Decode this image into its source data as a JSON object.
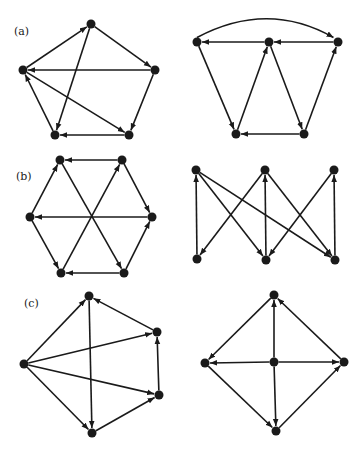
{
  "colors": {
    "ink": "#1a1a1a",
    "background": "#ffffff"
  },
  "panels": [
    {
      "id": "a-left",
      "label": "(a)",
      "label_pos": [
        14,
        33
      ],
      "nodes": {
        "top": [
          91,
          24
        ],
        "right": [
          155,
          70
        ],
        "bottom_right": [
          129,
          135
        ],
        "bottom_left": [
          55,
          135
        ],
        "left": [
          23,
          70
        ]
      },
      "edges": [
        [
          "left",
          "top"
        ],
        [
          "top",
          "right"
        ],
        [
          "top",
          "bottom_left"
        ],
        [
          "right",
          "left"
        ],
        [
          "right",
          "bottom_right"
        ],
        [
          "bottom_right",
          "bottom_left"
        ],
        [
          "left",
          "bottom_right"
        ],
        [
          "bottom_left",
          "left"
        ]
      ]
    },
    {
      "id": "a-right",
      "label": "",
      "nodes": {
        "left": [
          197,
          42
        ],
        "middle": [
          269,
          42
        ],
        "right": [
          338,
          42
        ],
        "bottom_left": [
          236,
          134
        ],
        "bottom_right": [
          304,
          134
        ]
      },
      "edges": [
        [
          "left",
          "right",
          "arc"
        ],
        [
          "right",
          "middle"
        ],
        [
          "middle",
          "left"
        ],
        [
          "left",
          "bottom_left"
        ],
        [
          "bottom_left",
          "middle"
        ],
        [
          "middle",
          "bottom_right"
        ],
        [
          "bottom_right",
          "bottom_left"
        ],
        [
          "bottom_right",
          "right"
        ]
      ]
    },
    {
      "id": "b-left",
      "label": "(b)",
      "label_pos": [
        16,
        178
      ],
      "nodes": {
        "top_left": [
          60,
          160
        ],
        "top_right": [
          122,
          160
        ],
        "right": [
          152,
          217
        ],
        "bottom_right": [
          124,
          273
        ],
        "bottom_left": [
          61,
          273
        ],
        "left": [
          30,
          217
        ]
      },
      "edges": [
        [
          "top_right",
          "top_left"
        ],
        [
          "top_left",
          "bottom_right"
        ],
        [
          "bottom_left",
          "top_right"
        ],
        [
          "top_right",
          "right"
        ],
        [
          "right",
          "left"
        ],
        [
          "left",
          "top_left"
        ],
        [
          "left",
          "bottom_left"
        ],
        [
          "bottom_right",
          "bottom_left"
        ],
        [
          "bottom_right",
          "right"
        ]
      ]
    },
    {
      "id": "b-right",
      "label": "",
      "nodes": {
        "t1": [
          196,
          170
        ],
        "t2": [
          265,
          170
        ],
        "t3": [
          334,
          170
        ],
        "b1": [
          197,
          259
        ],
        "b2": [
          266,
          260
        ],
        "b3": [
          335,
          260
        ]
      },
      "edges": [
        [
          "b1",
          "t1"
        ],
        [
          "t1",
          "b2"
        ],
        [
          "t1",
          "b3"
        ],
        [
          "t2",
          "b1"
        ],
        [
          "b2",
          "t2"
        ],
        [
          "t2",
          "b3"
        ],
        [
          "t3",
          "b2"
        ],
        [
          "b3",
          "t3"
        ]
      ]
    },
    {
      "id": "c-left",
      "label": "(c)",
      "label_pos": [
        24,
        305
      ],
      "nodes": {
        "top": [
          89,
          296
        ],
        "upper_right": [
          157,
          332
        ],
        "lower_right": [
          159,
          395
        ],
        "bottom": [
          92,
          433
        ],
        "left": [
          24,
          364
        ]
      },
      "edges": [
        [
          "left",
          "top"
        ],
        [
          "left",
          "upper_right"
        ],
        [
          "left",
          "lower_right"
        ],
        [
          "left",
          "bottom"
        ],
        [
          "top",
          "bottom"
        ],
        [
          "upper_right",
          "top"
        ],
        [
          "lower_right",
          "upper_right"
        ],
        [
          "bottom",
          "lower_right"
        ]
      ]
    },
    {
      "id": "c-right",
      "label": "",
      "nodes": {
        "top": [
          274,
          295
        ],
        "left": [
          205,
          363
        ],
        "center": [
          274,
          362
        ],
        "right": [
          344,
          362
        ],
        "bottom": [
          276,
          431
        ]
      },
      "edges": [
        [
          "top",
          "left"
        ],
        [
          "center",
          "top"
        ],
        [
          "center",
          "left"
        ],
        [
          "center",
          "right"
        ],
        [
          "center",
          "bottom"
        ],
        [
          "left",
          "bottom"
        ],
        [
          "bottom",
          "right"
        ],
        [
          "right",
          "top"
        ]
      ]
    }
  ]
}
